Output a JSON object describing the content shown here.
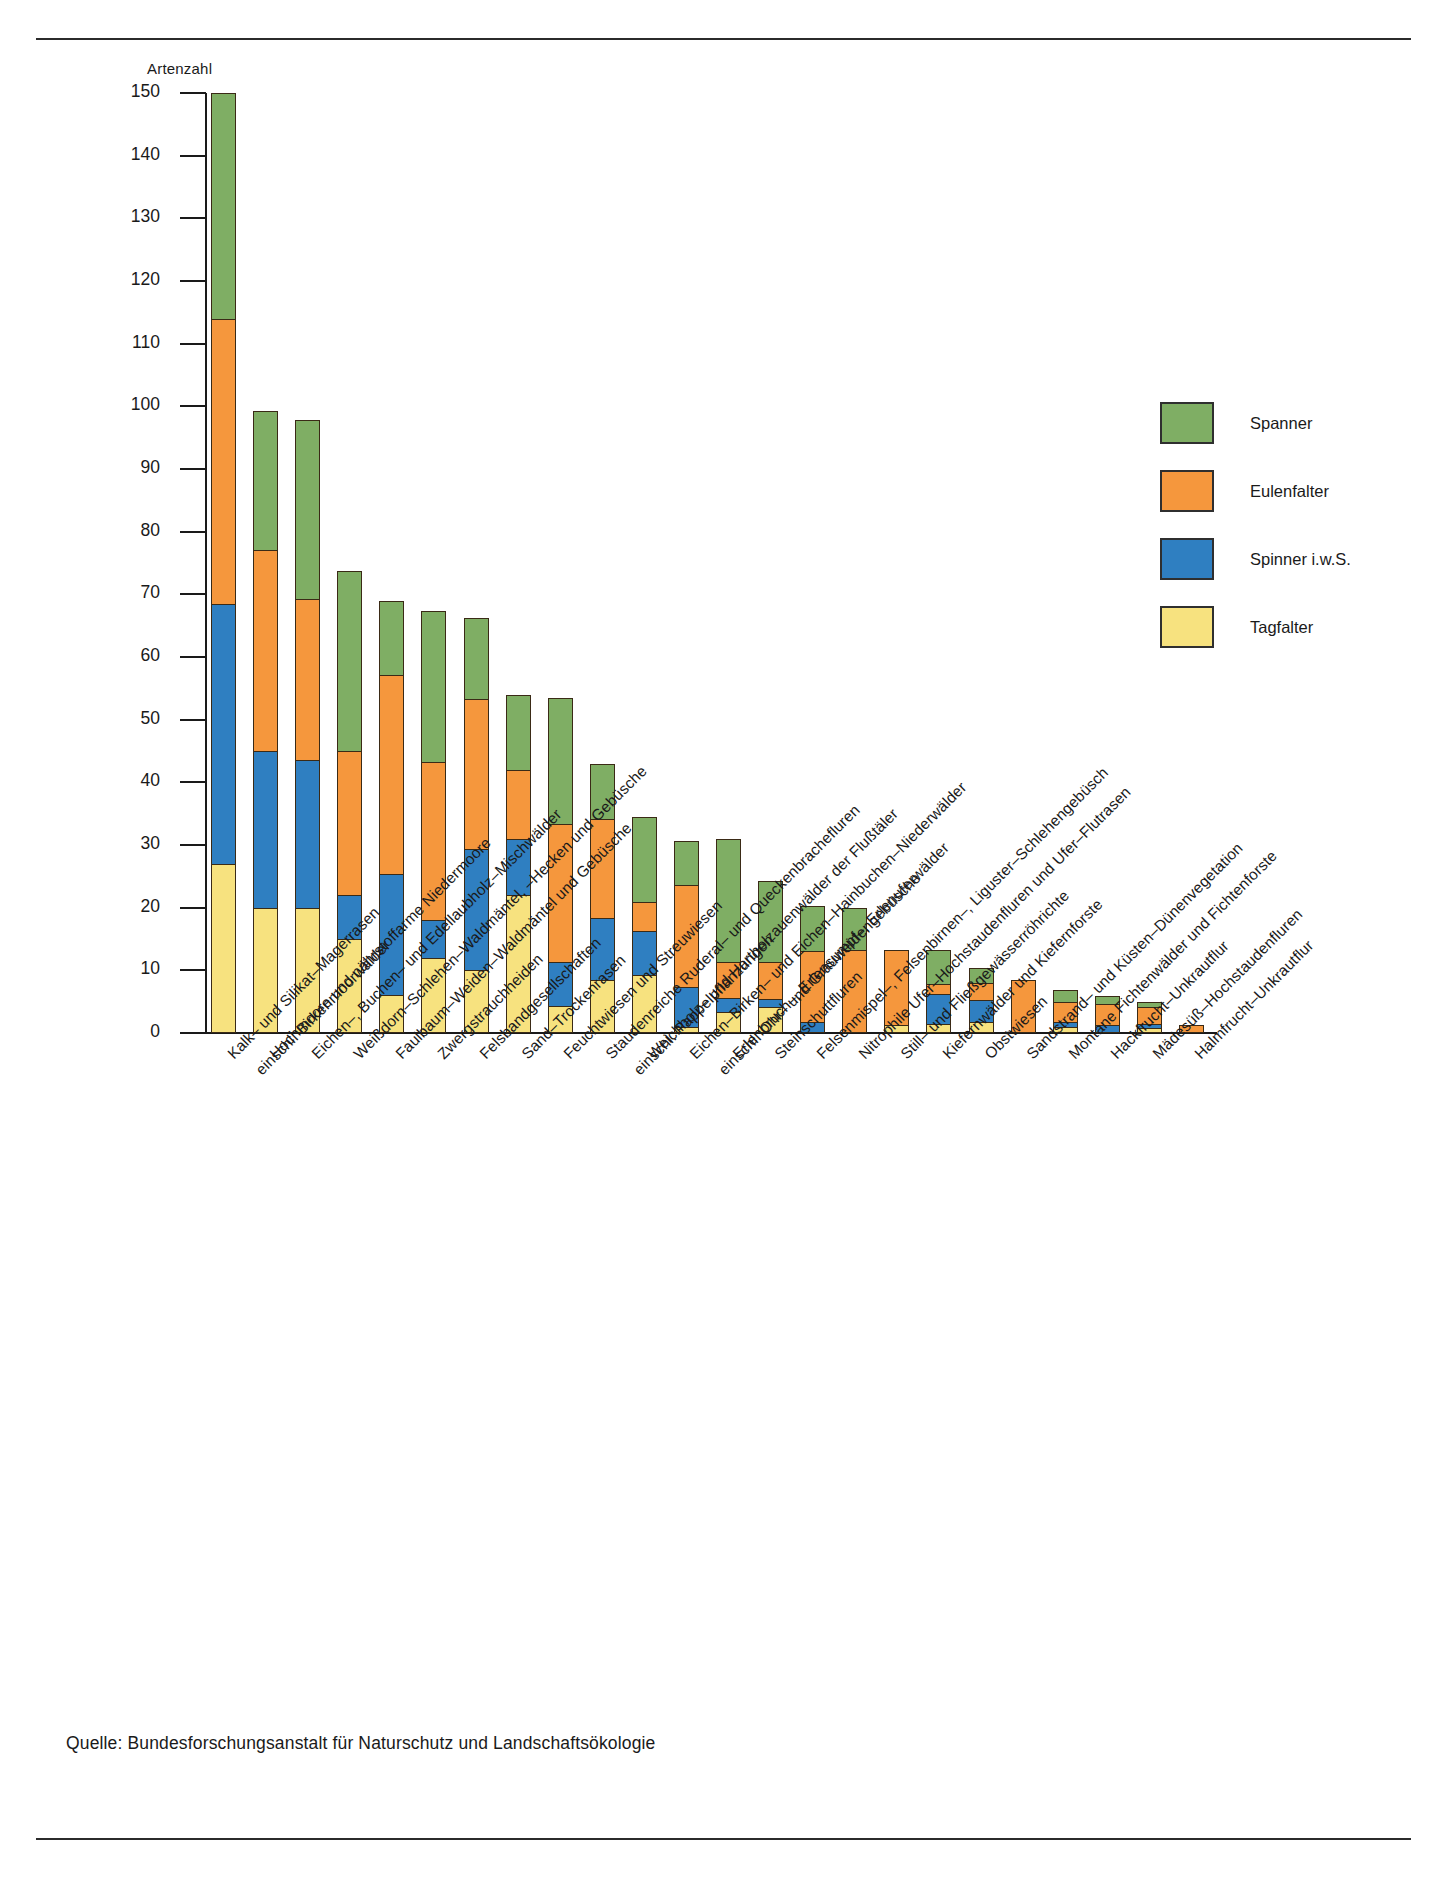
{
  "page": {
    "source_note": "Quelle:  Bundesforschungsanstalt für Naturschutz und Landschaftsökologie"
  },
  "legend": {
    "position": "right",
    "items": [
      {
        "label": "Spanner",
        "color": "#7fae64"
      },
      {
        "label": "Eulenfalter",
        "color": "#f5973d"
      },
      {
        "label": "Spinner i.w.S.",
        "color": "#2f7fc1"
      },
      {
        "label": "Tagfalter",
        "color": "#f7e27f"
      }
    ]
  },
  "chart_data": {
    "type": "bar",
    "stacked": true,
    "title": "",
    "xlabel": "",
    "ylabel": "Artenzahl",
    "ylim": [
      0,
      150
    ],
    "yticks": [
      0,
      10,
      20,
      30,
      40,
      50,
      60,
      70,
      80,
      90,
      100,
      110,
      120,
      130,
      140,
      150
    ],
    "grid": false,
    "legend_position": "right",
    "categories": [
      "Kalk– und Silikat–Magerrasen",
      "Hochmoore und nährstoffarme Niedermoore einschl. Birkenmoorwälder",
      "Eichen–, Buchen– und Edellaubholz–Mischwälder",
      "Weißdorn–Schlehen–Waldmäntel, –Hecken und Gebüsche",
      "Faulbaum–Weiden–Waldmäntel und Gebüsche",
      "Zwergstrauchheiden",
      "Felsbandgesellschaften",
      "Sand–Trockenrasen",
      "Feuchtwiesen und Streuwiesen",
      "Staudenreiche Ruderal– und Queckenbrachefluren",
      "Weichholz– und Hartholzauenwälder der Flußtäler einschl. Pappelpflanzungen",
      "Eichen–Birken– und Eichen–Hainbuchen–Niederwälder",
      "Erlenbruch–, Erlensumpf–, Erlenuferwälder einschl. Ohr– und Grauweidengebüsche",
      "Steinschuttfluren",
      "Felsenmispel–, Felsenbirnen–, Liguster–Schlehengebüsch",
      "Nitrophile Ufer–Hochstaudenfluren und Ufer–Flutrasen",
      "Still– und Fließgewässerröhrichte",
      "Kiefernwälder und Kiefernforste",
      "Obstwiesen",
      "Sandstrand– und Küsten–Dünenvegetation",
      "Montane Fichtenwälder und Fichtenforste",
      "Hackfrucht–Unkrautflur",
      "Mädesüß–Hochstaudenfluren",
      "Halmfrucht–Unkrautflur"
    ],
    "series": [
      {
        "name": "Tagfalter",
        "color": "#f7e27f",
        "values": [
          27,
          20,
          20,
          15,
          6,
          12,
          10,
          22,
          4.3,
          8.5,
          9.3,
          1,
          3.3,
          4.2,
          0,
          0,
          1.3,
          1.5,
          1.8,
          0,
          1,
          0,
          0.8,
          0
        ]
      },
      {
        "name": "Spinner i.w.S.",
        "color": "#2f7fc1",
        "values": [
          41.5,
          25,
          23.5,
          7,
          19.3,
          6,
          19.3,
          9,
          7,
          9.8,
          7,
          6.3,
          2.3,
          1.3,
          1.8,
          0,
          0,
          4.8,
          3.4,
          0,
          0.7,
          1.2,
          0.7,
          0
        ]
      },
      {
        "name": "Eulenfalter",
        "color": "#f5973d",
        "values": [
          45.5,
          32,
          25.8,
          23,
          31.8,
          25.3,
          24,
          11,
          22,
          15.8,
          4.6,
          16.4,
          5.8,
          5.8,
          11.3,
          13.3,
          12,
          1.5,
          2.8,
          8.4,
          3.3,
          3.4,
          2.6,
          1.2
        ]
      },
      {
        "name": "Spanner",
        "color": "#7fae64",
        "values": [
          36,
          22.2,
          28.5,
          28.8,
          11.9,
          24.1,
          12.9,
          12,
          20.2,
          8.9,
          13.5,
          7,
          19.6,
          13,
          7.1,
          6.7,
          0,
          5.5,
          2.4,
          0,
          1.9,
          1.3,
          0.9,
          0
        ]
      }
    ],
    "totals": [
      150,
      99.2,
      97.8,
      73.8,
      69,
      67.4,
      66.2,
      54,
      53.5,
      42.6,
      34.4,
      30.7,
      30.2,
      24.3,
      20.2,
      20,
      13.3,
      13.3,
      10.4,
      8.4,
      6.9,
      5.9,
      5,
      1.2
    ]
  }
}
